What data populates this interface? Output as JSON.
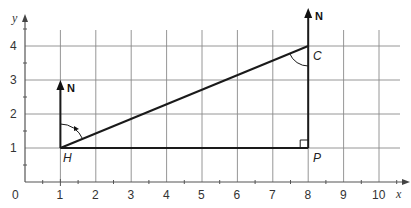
{
  "diagram": {
    "axes": {
      "x_label": "x",
      "y_label": "y",
      "origin_label": "0",
      "x_ticks": [
        "1",
        "2",
        "3",
        "4",
        "5",
        "6",
        "7",
        "8",
        "9",
        "10"
      ],
      "y_ticks": [
        "1",
        "2",
        "3",
        "4"
      ]
    },
    "points": {
      "H": {
        "label": "H",
        "x": 1,
        "y": 1
      },
      "C": {
        "label": "C",
        "x": 8,
        "y": 4
      },
      "P": {
        "label": "P",
        "x": 8,
        "y": 1
      }
    },
    "north_arrows": [
      {
        "label": "N",
        "at": "H"
      },
      {
        "label": "N",
        "at": "C"
      }
    ],
    "annotations": {
      "right_angle_at": "P",
      "bearing_arc_at": "H",
      "angle_arc_at": "C"
    }
  }
}
